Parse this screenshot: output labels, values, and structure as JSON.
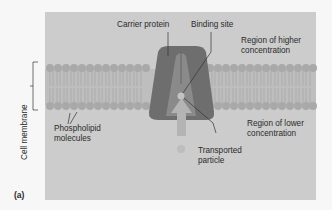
{
  "figure": {
    "panel_label": "(a)",
    "labels": {
      "carrier_protein": "Carrier protein",
      "binding_site": "Binding site",
      "higher_region_line1": "Region of higher",
      "higher_region_line2": "concentration",
      "lower_region_line1": "Region of lower",
      "lower_region_line2": "concentration",
      "transported_line1": "Transported",
      "transported_line2": "particle",
      "phospholipid_line1": "Phospholipid",
      "phospholipid_line2": "molecules",
      "cell_membrane": "Cell membrane"
    },
    "colors": {
      "background": "#cccccc",
      "membrane_heads": "#a9a9a9",
      "protein": "#6e6e6e",
      "protein_channel": "#8a8a8a",
      "arrow": "#b4b4b4",
      "particle": "#bdbdbd"
    }
  }
}
